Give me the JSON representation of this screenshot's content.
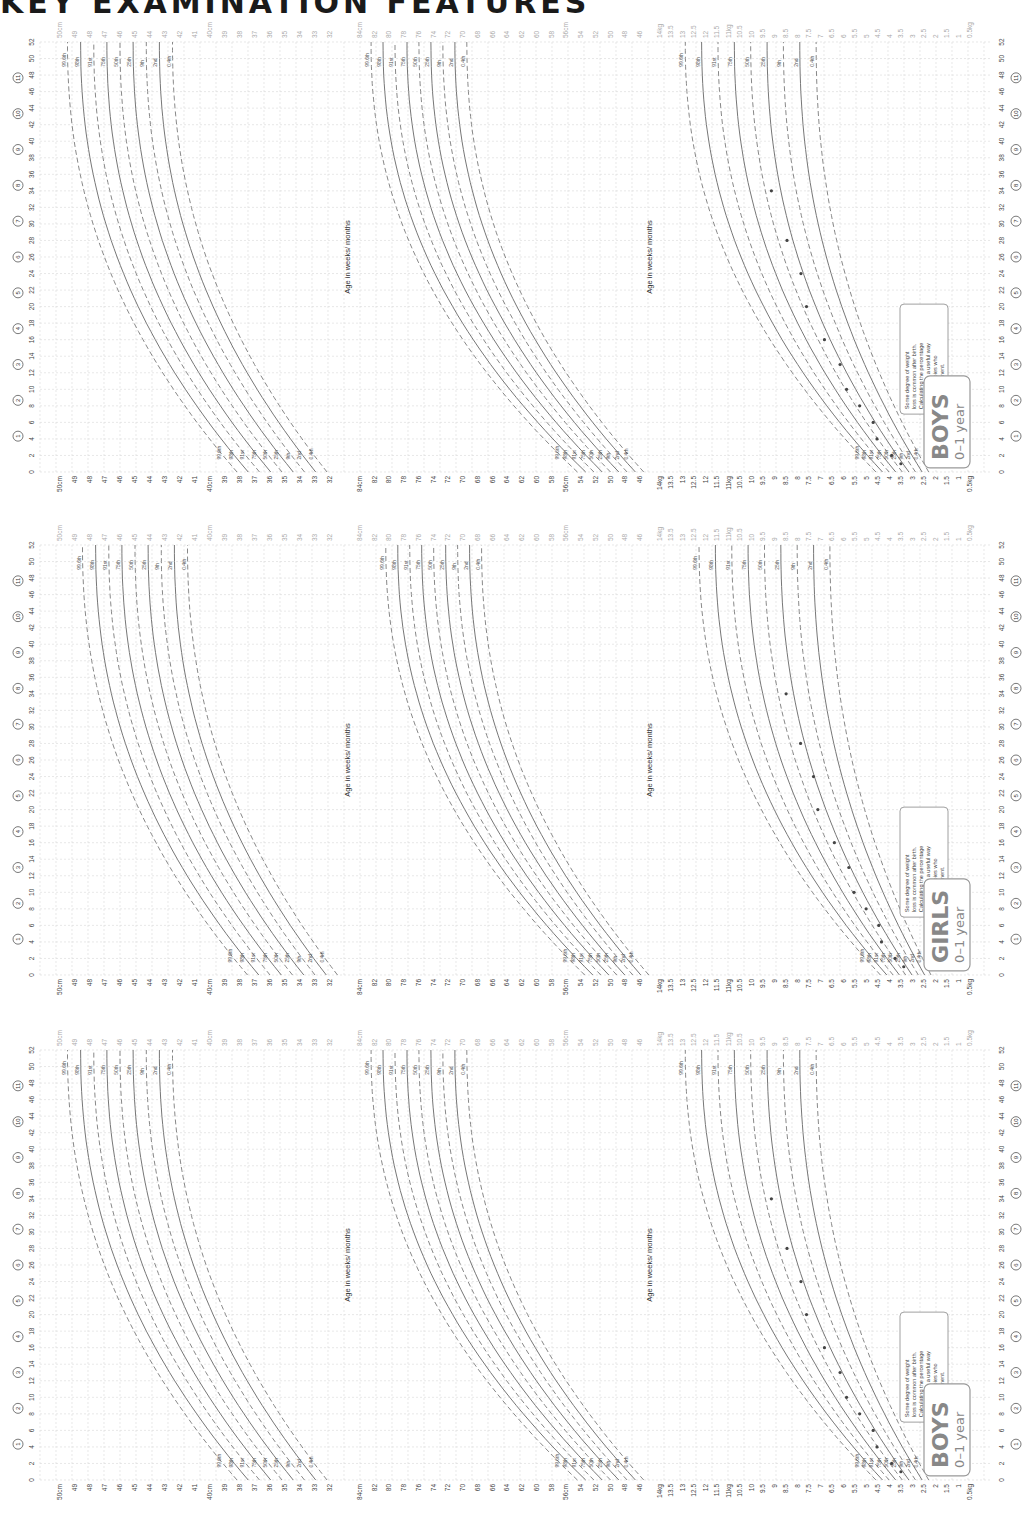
{
  "page": {
    "heading": "KEY EXAMINATION FEATURES"
  },
  "charts": [
    {
      "badge_title": "BOYS",
      "badge_subtitle": "0–1 year",
      "age_axis_title": "Age in weeks/ months",
      "callout": [
        "Some degree of weight",
        "loss is common after birth.",
        "Calculating the percentage",
        "weight loss is a useful way",
        "to identify babies who",
        "need assessment."
      ],
      "has_dots": true
    },
    {
      "badge_title": "GIRLS",
      "badge_subtitle": "0–1 year",
      "age_axis_title": "Age in weeks/ months",
      "callout": [
        "Some degree of weight",
        "loss is common after birth.",
        "Calculating the percentage",
        "weight loss is a useful way",
        "to identify babies who",
        "need assessment."
      ],
      "has_dots": true
    },
    {
      "badge_title": "BOYS",
      "badge_subtitle": "0–1 year",
      "age_axis_title": "Age in weeks/ months",
      "callout": [
        "Some degree of weight",
        "loss is common after birth.",
        "Calculating the percentage",
        "weight loss is a useful way",
        "to identify babies who",
        "need assessment."
      ],
      "has_dots": true
    }
  ],
  "axes": {
    "age_weeks_ticks": [
      "0",
      "2",
      "4",
      "6",
      "8",
      "10",
      "12",
      "14",
      "16",
      "18",
      "20",
      "22",
      "24",
      "26",
      "28",
      "30",
      "32",
      "34",
      "36",
      "38",
      "40",
      "42",
      "44",
      "46",
      "48",
      "50",
      "52"
    ],
    "month_markers": [
      "1",
      "2",
      "3",
      "4",
      "5",
      "6",
      "7",
      "8",
      "9",
      "10",
      "11"
    ],
    "head_circumference_cm": {
      "unit": "cm",
      "ticks": [
        "50cm",
        "49",
        "48",
        "47",
        "46",
        "45",
        "44",
        "43",
        "42",
        "41",
        "40cm",
        "39",
        "38",
        "37",
        "36",
        "35",
        "34",
        "33",
        "32"
      ]
    },
    "length_cm": {
      "unit": "cm",
      "ticks": [
        "84cm",
        "82",
        "80",
        "78",
        "76",
        "74",
        "72",
        "70",
        "68",
        "66",
        "64",
        "62",
        "60",
        "58",
        "56cm",
        "54",
        "52",
        "50",
        "48",
        "46"
      ]
    },
    "weight_kg": {
      "unit": "kg",
      "ticks": [
        "14kg",
        "13.5",
        "13",
        "12.5",
        "12",
        "11.5",
        "11kg",
        "10.5",
        "10",
        "9.5",
        "9",
        "8.5",
        "8",
        "7.5",
        "7",
        "6.5",
        "6",
        "5.5",
        "5",
        "4.5",
        "4",
        "3.5",
        "3",
        "2.5",
        "2",
        "1.5",
        "1",
        "0.5kg"
      ]
    },
    "centiles": [
      "99.6th",
      "98th",
      "91st",
      "75th",
      "50th",
      "25th",
      "9th",
      "2nd",
      "0.4th"
    ]
  },
  "chart_data": [
    {
      "type": "line",
      "title": "BOYS 0–1 year",
      "xlabel": "Age in weeks/ months",
      "panels": [
        {
          "name": "Head circumference",
          "ylabel": "cm",
          "ylim": [
            32,
            50
          ],
          "series": [
            {
              "name": "99.6th",
              "values_at_0_52wk": [
                38.2,
                49.5
              ]
            },
            {
              "name": "50th",
              "values_at_0_52wk": [
                35.0,
                46.0
              ]
            },
            {
              "name": "0.4th",
              "values_at_0_52wk": [
                32.2,
                42.5
              ]
            }
          ]
        },
        {
          "name": "Length",
          "ylabel": "cm",
          "ylim": [
            46,
            84
          ],
          "series": [
            {
              "name": "99.6th",
              "values_at_0_52wk": [
                54.5,
                82.5
              ]
            },
            {
              "name": "50th",
              "values_at_0_52wk": [
                49.9,
                75.7
              ]
            },
            {
              "name": "0.4th",
              "values_at_0_52wk": [
                45.5,
                69.5
              ]
            }
          ]
        },
        {
          "name": "Weight",
          "ylabel": "kg",
          "ylim": [
            0.5,
            14
          ],
          "series": [
            {
              "name": "99.6th",
              "values_at_0_52wk": [
                4.6,
                12.9
              ]
            },
            {
              "name": "50th",
              "values_at_0_52wk": [
                3.4,
                9.6
              ]
            },
            {
              "name": "0.4th",
              "values_at_0_52wk": [
                2.3,
                7.2
              ]
            }
          ]
        }
      ]
    },
    {
      "type": "line",
      "title": "GIRLS 0–1 year",
      "xlabel": "Age in weeks/ months",
      "panels": [
        {
          "name": "Head circumference",
          "ylabel": "cm",
          "ylim": [
            32,
            50
          ],
          "series": [
            {
              "name": "99.6th",
              "values_at_0_52wk": [
                37.5,
                48.5
              ]
            },
            {
              "name": "50th",
              "values_at_0_52wk": [
                34.3,
                45.0
              ]
            },
            {
              "name": "0.4th",
              "values_at_0_52wk": [
                31.5,
                41.5
              ]
            }
          ]
        },
        {
          "name": "Length",
          "ylabel": "cm",
          "ylim": [
            46,
            84
          ],
          "series": [
            {
              "name": "99.6th",
              "values_at_0_52wk": [
                53.5,
                80.5
              ]
            },
            {
              "name": "50th",
              "values_at_0_52wk": [
                49.1,
                74.0
              ]
            },
            {
              "name": "0.4th",
              "values_at_0_52wk": [
                44.8,
                67.5
              ]
            }
          ]
        },
        {
          "name": "Weight",
          "ylabel": "kg",
          "ylim": [
            0.5,
            14
          ],
          "series": [
            {
              "name": "99.6th",
              "values_at_0_52wk": [
                4.4,
                12.3
              ]
            },
            {
              "name": "50th",
              "values_at_0_52wk": [
                3.3,
                8.9
              ]
            },
            {
              "name": "0.4th",
              "values_at_0_52wk": [
                2.2,
                6.6
              ]
            }
          ]
        }
      ]
    },
    {
      "type": "line",
      "title": "BOYS 0–1 year",
      "xlabel": "Age in weeks/ months",
      "panels": [
        {
          "name": "Head circumference",
          "ylabel": "cm",
          "ylim": [
            32,
            50
          ],
          "series": [
            {
              "name": "99.6th",
              "values_at_0_52wk": [
                38.2,
                49.5
              ]
            },
            {
              "name": "50th",
              "values_at_0_52wk": [
                35.0,
                46.0
              ]
            },
            {
              "name": "0.4th",
              "values_at_0_52wk": [
                32.2,
                42.5
              ]
            }
          ]
        },
        {
          "name": "Length",
          "ylabel": "cm",
          "ylim": [
            46,
            84
          ],
          "series": [
            {
              "name": "99.6th",
              "values_at_0_52wk": [
                54.5,
                82.5
              ]
            },
            {
              "name": "50th",
              "values_at_0_52wk": [
                49.9,
                75.7
              ]
            },
            {
              "name": "0.4th",
              "values_at_0_52wk": [
                45.5,
                69.5
              ]
            }
          ]
        },
        {
          "name": "Weight",
          "ylabel": "kg",
          "ylim": [
            0.5,
            14
          ],
          "series": [
            {
              "name": "99.6th",
              "values_at_0_52wk": [
                4.6,
                12.9
              ]
            },
            {
              "name": "50th",
              "values_at_0_52wk": [
                3.4,
                9.6
              ]
            },
            {
              "name": "0.4th",
              "values_at_0_52wk": [
                2.3,
                7.2
              ]
            }
          ]
        }
      ]
    }
  ]
}
